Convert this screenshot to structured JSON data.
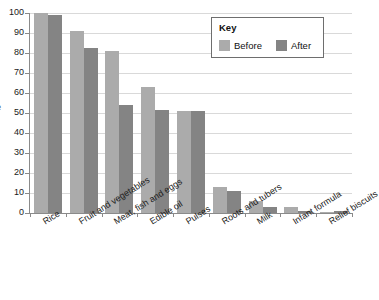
{
  "chart_data": {
    "type": "bar",
    "title": "",
    "subtitle": "",
    "xlabel": "",
    "ylabel": "e",
    "ylim": [
      0,
      100
    ],
    "grid": true,
    "legend_position": "top-right",
    "categories": [
      "Rice",
      "Fruit and vegetables",
      "Meat, fish and eggs",
      "Edible oil",
      "Pulses",
      "Roots and tubers",
      "Milk",
      "Infant formula",
      "Relief biscuits"
    ],
    "series": [
      {
        "name": "Before",
        "color": "#ababab",
        "values": [
          100,
          91,
          81,
          63,
          51,
          13,
          6,
          3,
          0.3
        ]
      },
      {
        "name": "After",
        "color": "#848484",
        "values": [
          99,
          82.5,
          54,
          51.5,
          51,
          11,
          3,
          1,
          1
        ]
      }
    ],
    "y_ticks": [
      0,
      10,
      20,
      30,
      40,
      50,
      60,
      70,
      80,
      90,
      100
    ]
  },
  "legend": {
    "title": "Key",
    "entries": [
      {
        "label": "Before",
        "color": "#ababab"
      },
      {
        "label": "After",
        "color": "#848484"
      }
    ]
  },
  "axis": {
    "y_title": "e",
    "y_tick_labels": [
      "100",
      "90",
      "80",
      "70",
      "60",
      "50",
      "40",
      "30",
      "20",
      "10",
      "0"
    ]
  }
}
